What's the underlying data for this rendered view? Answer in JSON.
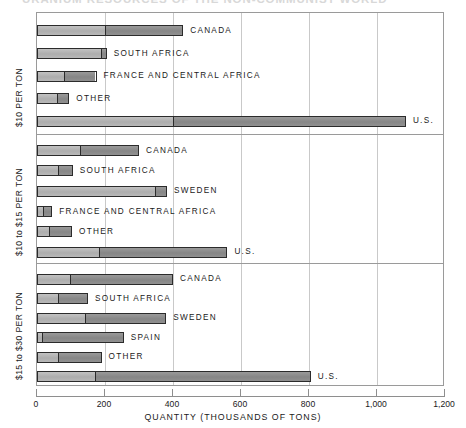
{
  "chart_data": {
    "type": "bar",
    "orientation": "horizontal",
    "title": "URANIUM RESOURCES OF THE NON-COMMUNIST WORLD",
    "xlabel": "QUANTITY (THOUSANDS OF TONS)",
    "ylabel": "",
    "xlim": [
      0,
      1200
    ],
    "xticks": [
      0,
      200,
      400,
      600,
      800,
      1000,
      1200
    ],
    "xticklabels": [
      "0",
      "200",
      "400",
      "600",
      "800",
      "1,000",
      "1,200"
    ],
    "grid": true,
    "legend": "none",
    "stacked": true,
    "series": [
      {
        "name": "reasonably-assured",
        "color": "#b4b4b4"
      },
      {
        "name": "estimated-additional",
        "color": "#8d8d8d"
      }
    ],
    "panels": [
      {
        "label": "$10 PER TON",
        "bars": [
          {
            "name": "CANADA",
            "segments": [
              200,
              230
            ],
            "total": 430
          },
          {
            "name": "SOUTH AFRICA",
            "segments": [
              192,
              13
            ],
            "total": 205
          },
          {
            "name": "FRANCE AND CENTRAL AFRICA",
            "segments": [
              80,
              95
            ],
            "total": 175
          },
          {
            "name": "OTHER",
            "segments": [
              59,
              36
            ],
            "total": 95
          },
          {
            "name": "U.S.",
            "segments": [
              400,
              685
            ],
            "total": 1085
          }
        ]
      },
      {
        "label": "$10 to $15 PER TON",
        "bars": [
          {
            "name": "CANADA",
            "segments": [
              125,
              175
            ],
            "total": 300
          },
          {
            "name": "SOUTH AFRICA",
            "segments": [
              62,
              43
            ],
            "total": 105
          },
          {
            "name": "SWEDEN",
            "segments": [
              350,
              32
            ],
            "total": 382
          },
          {
            "name": "FRANCE AND CENTRAL AFRICA",
            "segments": [
              18,
              27
            ],
            "total": 45
          },
          {
            "name": "OTHER",
            "segments": [
              35,
              68
            ],
            "total": 103
          },
          {
            "name": "U.S.",
            "segments": [
              180,
              380
            ],
            "total": 560
          }
        ]
      },
      {
        "label": "$15 to $30 PER TON",
        "bars": [
          {
            "name": "CANADA",
            "segments": [
              95,
              305
            ],
            "total": 400
          },
          {
            "name": "SOUTH AFRICA",
            "segments": [
              62,
              88
            ],
            "total": 150
          },
          {
            "name": "SWEDEN",
            "segments": [
              140,
              240
            ],
            "total": 380
          },
          {
            "name": "SPAIN",
            "segments": [
              12,
              243
            ],
            "total": 255
          },
          {
            "name": "OTHER",
            "segments": [
              62,
              128
            ],
            "total": 190
          },
          {
            "name": "U.S.",
            "segments": [
              168,
              637
            ],
            "total": 805
          }
        ]
      }
    ]
  }
}
